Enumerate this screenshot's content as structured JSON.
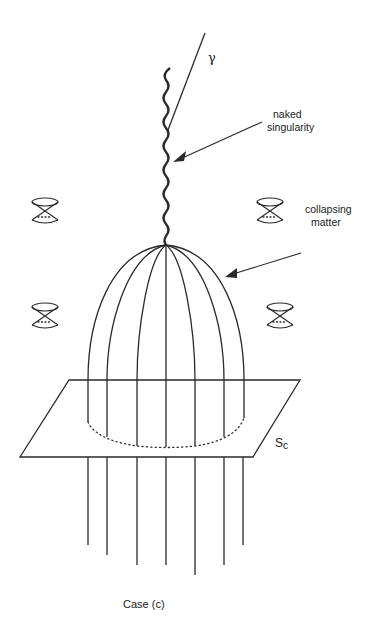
{
  "figure": {
    "caption": "Case (c)",
    "labels": {
      "gamma": "γ",
      "naked_singularity_line1": "naked",
      "naked_singularity_line2": "singularity",
      "collapsing_matter_line1": "collapsing",
      "collapsing_matter_line2": "matter",
      "surface": "S",
      "surface_subscript": "c"
    },
    "colors": {
      "ink": "#2a2a2a",
      "background": "#ffffff"
    },
    "elements": {
      "light_cones": [
        {
          "id": "cone-top-left",
          "cx": 45,
          "cy": 211
        },
        {
          "id": "cone-bottom-left",
          "cx": 45,
          "cy": 316
        },
        {
          "id": "cone-top-right",
          "cx": 270,
          "cy": 211
        },
        {
          "id": "cone-bottom-right",
          "cx": 280,
          "cy": 316
        }
      ],
      "plane_corners": [
        [
          69,
          380
        ],
        [
          300,
          380
        ],
        [
          253,
          457
        ],
        [
          20,
          457
        ]
      ],
      "worldlines_below_plane_x": [
        88,
        107,
        137,
        166,
        195,
        224,
        243
      ],
      "worldlines_below_plane_end_y": [
        545,
        555,
        565,
        565,
        575,
        565,
        545
      ],
      "dome_apex": [
        166,
        245
      ],
      "singularity_top_y": 68
    }
  }
}
